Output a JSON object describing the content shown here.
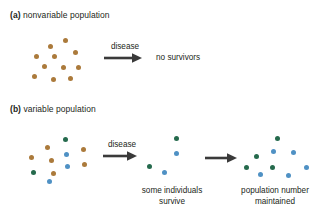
{
  "figure": {
    "background": "#ffffff",
    "colors": {
      "brown": "#ab7a3b",
      "green": "#256a4d",
      "blue": "#4f91c4",
      "text": "#231f20",
      "arrow": "#3a3a3a"
    }
  },
  "panel_a": {
    "tag": "(a)",
    "title": "nonvariable population",
    "arrow_label": "disease",
    "outcome": "no survivors",
    "population": {
      "dots": [
        {
          "color": "brown",
          "x": 20,
          "y": 12
        },
        {
          "color": "brown",
          "x": 35,
          "y": 6
        },
        {
          "color": "brown",
          "x": 6,
          "y": 22
        },
        {
          "color": "brown",
          "x": 24,
          "y": 22
        },
        {
          "color": "brown",
          "x": 45,
          "y": 18
        },
        {
          "color": "brown",
          "x": 14,
          "y": 32
        },
        {
          "color": "brown",
          "x": 33,
          "y": 33
        },
        {
          "color": "brown",
          "x": 48,
          "y": 33
        },
        {
          "color": "brown",
          "x": 4,
          "y": 42
        },
        {
          "color": "brown",
          "x": 23,
          "y": 45
        },
        {
          "color": "brown",
          "x": 40,
          "y": 44
        }
      ]
    }
  },
  "panel_b": {
    "tag": "(b)",
    "title": "variable population",
    "arrow_label": "disease",
    "caption_survivors_line1": "some individuals",
    "caption_survivors_line2": "survive",
    "caption_maintained_line1": "population number",
    "caption_maintained_line2": "maintained",
    "population": {
      "dots": [
        {
          "color": "green",
          "x": 39,
          "y": 3
        },
        {
          "color": "brown",
          "x": 21,
          "y": 11
        },
        {
          "color": "brown",
          "x": 57,
          "y": 13
        },
        {
          "color": "brown",
          "x": 5,
          "y": 21
        },
        {
          "color": "blue",
          "x": 40,
          "y": 18
        },
        {
          "color": "brown",
          "x": 25,
          "y": 24
        },
        {
          "color": "brown",
          "x": 58,
          "y": 28
        },
        {
          "color": "blue",
          "x": 41,
          "y": 30
        },
        {
          "color": "green",
          "x": 7,
          "y": 36
        },
        {
          "color": "brown",
          "x": 27,
          "y": 37
        },
        {
          "color": "blue",
          "x": 23,
          "y": 45
        }
      ]
    },
    "survivors": {
      "dots": [
        {
          "color": "green",
          "x": 31,
          "y": 4
        },
        {
          "color": "blue",
          "x": 31,
          "y": 19
        },
        {
          "color": "green",
          "x": 4,
          "y": 32
        },
        {
          "color": "blue",
          "x": 19,
          "y": 38
        }
      ]
    },
    "recovered": {
      "dots": [
        {
          "color": "green",
          "x": 31,
          "y": 4
        },
        {
          "color": "blue",
          "x": 27,
          "y": 17
        },
        {
          "color": "blue",
          "x": 47,
          "y": 18
        },
        {
          "color": "green",
          "x": 10,
          "y": 22
        },
        {
          "color": "green",
          "x": 0,
          "y": 33
        },
        {
          "color": "green",
          "x": 26,
          "y": 33
        },
        {
          "color": "blue",
          "x": 14,
          "y": 40
        },
        {
          "color": "blue",
          "x": 42,
          "y": 41
        },
        {
          "color": "blue",
          "x": 60,
          "y": 33
        }
      ]
    }
  },
  "chart_data": {
    "type": "diagram",
    "panels": [
      {
        "id": "a",
        "label": "nonvariable population",
        "initial_count": 11,
        "initial_composition": {
          "brown": 11,
          "green": 0,
          "blue": 0
        },
        "process": "disease",
        "final_count": 0,
        "final_label": "no survivors"
      },
      {
        "id": "b",
        "label": "variable population",
        "initial_count": 11,
        "initial_composition": {
          "brown": 6,
          "green": 2,
          "blue": 3
        },
        "process": "disease",
        "survivor_count": 4,
        "survivor_composition": {
          "brown": 0,
          "green": 2,
          "blue": 2
        },
        "survivor_label": "some individuals survive",
        "final_count": 9,
        "final_composition": {
          "brown": 0,
          "green": 4,
          "blue": 5
        },
        "final_label": "population number maintained"
      }
    ]
  }
}
